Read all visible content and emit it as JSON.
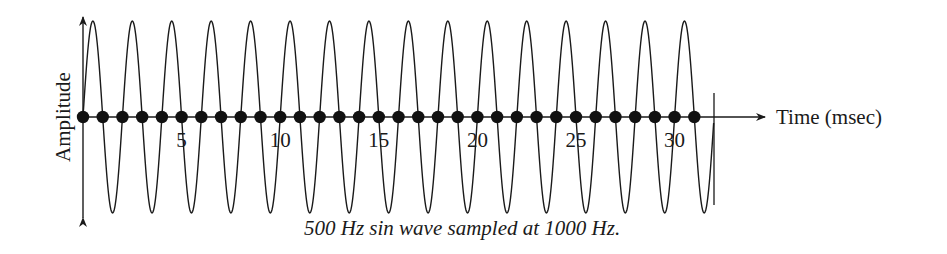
{
  "chart_data": {
    "type": "line",
    "title": "",
    "caption": "500 Hz sin wave sampled at 1000 Hz.",
    "xlabel": "Time (msec)",
    "ylabel": "Amplitude",
    "x_ticks": [
      5,
      10,
      15,
      20,
      25,
      30
    ],
    "xlim": [
      0,
      32
    ],
    "ylim": [
      -1,
      1
    ],
    "grid": false,
    "legend": null,
    "series": [
      {
        "name": "500 Hz sine wave",
        "kind": "continuous",
        "frequency_hz": 500,
        "amplitude": 1,
        "x_start": 0,
        "x_end": 32
      },
      {
        "name": "samples",
        "kind": "points",
        "sample_rate_hz": 1000,
        "x": [
          0,
          1,
          2,
          3,
          4,
          5,
          6,
          7,
          8,
          9,
          10,
          11,
          12,
          13,
          14,
          15,
          16,
          17,
          18,
          19,
          20,
          21,
          22,
          23,
          24,
          25,
          26,
          27,
          28,
          29,
          30,
          31
        ],
        "y": [
          0,
          0,
          0,
          0,
          0,
          0,
          0,
          0,
          0,
          0,
          0,
          0,
          0,
          0,
          0,
          0,
          0,
          0,
          0,
          0,
          0,
          0,
          0,
          0,
          0,
          0,
          0,
          0,
          0,
          0,
          0,
          0
        ]
      }
    ],
    "colors": {
      "line": "#1a1a1a",
      "background": "#ffffff"
    }
  },
  "layout": {
    "x0_px": 83,
    "px_per_ms": 19.72,
    "axis_y_px": 117,
    "amp_px": 96,
    "axis_end_px": 765,
    "yaxis_top_px": 17,
    "yaxis_bottom_px": 218,
    "end_marker_x_px": 714
  }
}
